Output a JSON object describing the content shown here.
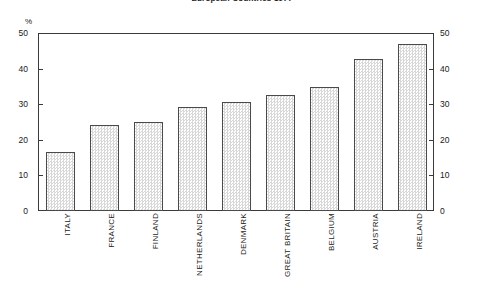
{
  "chart_data": {
    "type": "bar",
    "title": "European Countries 1977",
    "xlabel": "",
    "ylabel": "%",
    "unit_label": "%",
    "ylim": [
      0,
      50
    ],
    "yticks": [
      0,
      10,
      20,
      30,
      40,
      50
    ],
    "grid": false,
    "legend": false,
    "dual_axis": true,
    "categories": [
      "ITALY",
      "FRANCE",
      "FINLAND",
      "NETHERLANDS",
      "DENMARK",
      "GREAT BRITAIN",
      "BELGIUM",
      "AUSTRIA",
      "IRELAND"
    ],
    "values": [
      16.6,
      24.2,
      25.0,
      29.2,
      30.5,
      32.5,
      34.8,
      42.8,
      46.8
    ],
    "bar_fill": "#e8e8e8",
    "bar_border": "#4a4a4a",
    "axis_color": "#3a3a3a"
  },
  "axis": {
    "unit": "%",
    "left_ticks": [
      "50",
      "40",
      "30",
      "20",
      "10",
      "0"
    ],
    "right_ticks": [
      "50",
      "40",
      "30",
      "20",
      "10",
      "0"
    ]
  }
}
